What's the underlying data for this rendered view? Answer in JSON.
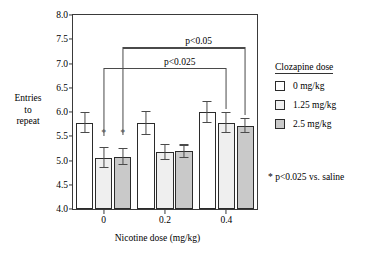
{
  "chart_data": {
    "type": "bar",
    "title": "",
    "xlabel": "Nicotine dose (mg/kg)",
    "ylabel": "Entries to repeat",
    "ylabel_lines": [
      "Entries",
      "to",
      "repeat"
    ],
    "categories": [
      "0",
      "0.2",
      "0.4"
    ],
    "ylim": [
      4.0,
      8.0
    ],
    "yticks": [
      "4.0",
      "4.5",
      "5.0",
      "5.5",
      "6.0",
      "6.5",
      "7.0",
      "7.5",
      "8.0"
    ],
    "ytick_values": [
      4.0,
      4.5,
      5.0,
      5.5,
      6.0,
      6.5,
      7.0,
      7.5,
      8.0
    ],
    "grid": false,
    "legend_position": "right",
    "series": [
      {
        "name": "0 mg/kg",
        "color": "#ffffff",
        "values": [
          5.78,
          5.78,
          6.0
        ],
        "errors": [
          0.22,
          0.25,
          0.22
        ]
      },
      {
        "name": "1.25 mg/kg",
        "color": "#efefef",
        "values": [
          5.06,
          5.17,
          5.78
        ],
        "errors": [
          0.21,
          0.17,
          0.22
        ]
      },
      {
        "name": "2.5 mg/kg",
        "color": "#c9c9c9",
        "values": [
          5.08,
          5.19,
          5.72
        ],
        "errors": [
          0.18,
          0.14,
          0.16
        ]
      }
    ],
    "annotations": [
      {
        "text": "p<0.05",
        "y": 7.33,
        "from_group": 0,
        "from_series": 2,
        "to_group": 2,
        "to_series": 2
      },
      {
        "text": "p<0.025",
        "y": 6.9,
        "from_group": 0,
        "from_series": 1,
        "to_group": 2,
        "to_series": 1
      }
    ],
    "markers": [
      {
        "text": "*",
        "group": 0,
        "series": 1,
        "y": 5.57
      },
      {
        "text": "*",
        "group": 0,
        "series": 2,
        "y": 5.57
      }
    ]
  },
  "legend": {
    "title": "Clozapine dose",
    "items": [
      {
        "label": "0 mg/kg",
        "color": "#ffffff"
      },
      {
        "label": "1.25 mg/kg",
        "color": "#efefef"
      },
      {
        "label": "2.5 mg/kg",
        "color": "#c9c9c9"
      }
    ]
  },
  "footnote": {
    "text": "* p<0.025 vs. saline"
  }
}
